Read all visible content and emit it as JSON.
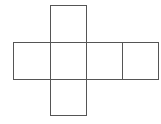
{
  "diagram": {
    "type": "cube-net",
    "stroke_color": "#555555",
    "squares": [
      {
        "name": "top-face",
        "x": 50,
        "y": 5,
        "w": 37,
        "h": 38
      },
      {
        "name": "left-face",
        "x": 13,
        "y": 42,
        "w": 38,
        "h": 38
      },
      {
        "name": "center-face",
        "x": 50,
        "y": 42,
        "w": 37,
        "h": 38
      },
      {
        "name": "right-face",
        "x": 86,
        "y": 42,
        "w": 37,
        "h": 38
      },
      {
        "name": "far-right-face",
        "x": 122,
        "y": 42,
        "w": 37,
        "h": 38
      },
      {
        "name": "bottom-face",
        "x": 50,
        "y": 79,
        "w": 37,
        "h": 37
      }
    ]
  }
}
